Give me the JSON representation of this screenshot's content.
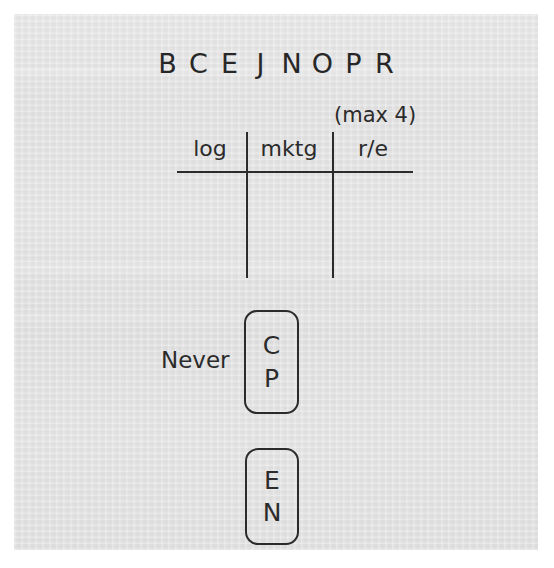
{
  "medium": "handwritten pen sketch on gray paper",
  "colors": {
    "paper": "#e2e2e2",
    "ink": "#2b2b2b",
    "margin": "#ffffff"
  },
  "letter_row": {
    "name": "initials-row",
    "letters": [
      "B",
      "C",
      "E",
      "J",
      "N",
      "O",
      "P",
      "R"
    ]
  },
  "table": {
    "note": "(max 4)",
    "columns": [
      {
        "header": "log"
      },
      {
        "header": "mktg"
      },
      {
        "header": "r/e"
      }
    ],
    "rows": []
  },
  "never_group": {
    "label": "Never",
    "box_items": [
      "C",
      "P"
    ]
  },
  "second_group": {
    "label": "",
    "box_items": [
      "E",
      "N"
    ]
  }
}
